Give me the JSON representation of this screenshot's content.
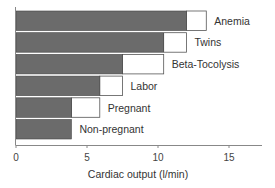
{
  "chart_data": {
    "type": "bar",
    "orientation": "horizontal",
    "stacked": true,
    "title": "",
    "xlabel": "Cardiac output (l/min)",
    "ylabel": "",
    "xlim": [
      0,
      17.5
    ],
    "xticks": [
      0,
      5,
      10,
      15
    ],
    "grid": false,
    "legend": null,
    "categories": [
      "Anemia",
      "Twins",
      "Beta-Tocolysis",
      "Labor",
      "Pregnant",
      "Non-pregnant"
    ],
    "series": [
      {
        "name": "base (dark)",
        "color": "#6b6b6b",
        "values": [
          12.0,
          10.4,
          7.5,
          5.9,
          3.9,
          3.9
        ]
      },
      {
        "name": "increase (white)",
        "color": "#ffffff",
        "values": [
          1.4,
          1.6,
          2.9,
          1.6,
          2.0,
          0
        ]
      }
    ],
    "totals": [
      13.4,
      12.0,
      10.4,
      7.5,
      5.9,
      3.9
    ]
  }
}
